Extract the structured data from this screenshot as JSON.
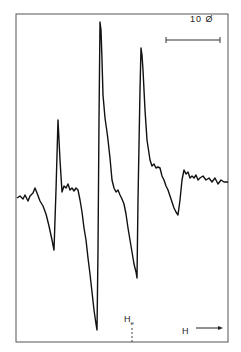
{
  "chart_data": {
    "type": "line",
    "title": "",
    "xlabel": "H",
    "ylabel": "",
    "grid": false,
    "legend": null,
    "annotations": [
      {
        "text": "10 Ø",
        "kind": "scale-bar",
        "description": "horizontal scale bar indicating 10 gauss"
      },
      {
        "text": "He",
        "kind": "marker",
        "description": "dashed tick marking field position He"
      },
      {
        "text": "H →",
        "kind": "axis-direction",
        "description": "arrow indicating increasing field direction"
      }
    ],
    "series": [
      {
        "name": "EPR derivative spectrum",
        "points_px": [
          [
            17,
            198
          ],
          [
            20,
            196
          ],
          [
            23,
            199
          ],
          [
            25,
            195
          ],
          [
            28,
            201
          ],
          [
            30,
            196
          ],
          [
            33,
            193
          ],
          [
            35,
            188
          ],
          [
            37,
            193
          ],
          [
            40,
            201
          ],
          [
            43,
            206
          ],
          [
            46,
            214
          ],
          [
            49,
            226
          ],
          [
            52,
            240
          ],
          [
            54,
            250
          ],
          [
            56,
            190
          ],
          [
            58,
            120
          ],
          [
            60,
            160
          ],
          [
            62,
            192
          ],
          [
            64,
            186
          ],
          [
            66,
            188
          ],
          [
            68,
            184
          ],
          [
            70,
            190
          ],
          [
            72,
            188
          ],
          [
            74,
            191
          ],
          [
            76,
            188
          ],
          [
            78,
            190
          ],
          [
            80,
            200
          ],
          [
            82,
            212
          ],
          [
            84,
            228
          ],
          [
            86,
            240
          ],
          [
            88,
            258
          ],
          [
            90,
            274
          ],
          [
            92,
            292
          ],
          [
            94,
            310
          ],
          [
            96,
            324
          ],
          [
            97,
            330
          ],
          [
            98,
            250
          ],
          [
            99,
            120
          ],
          [
            100,
            22
          ],
          [
            101,
            30
          ],
          [
            102,
            60
          ],
          [
            103,
            95
          ],
          [
            105,
            118
          ],
          [
            107,
            132
          ],
          [
            108,
            140
          ],
          [
            110,
            158
          ],
          [
            112,
            180
          ],
          [
            114,
            188
          ],
          [
            116,
            192
          ],
          [
            118,
            190
          ],
          [
            120,
            195
          ],
          [
            122,
            199
          ],
          [
            124,
            204
          ],
          [
            126,
            214
          ],
          [
            128,
            228
          ],
          [
            130,
            240
          ],
          [
            132,
            252
          ],
          [
            134,
            264
          ],
          [
            136,
            272
          ],
          [
            137,
            278
          ],
          [
            138,
            200
          ],
          [
            140,
            90
          ],
          [
            141,
            48
          ],
          [
            142,
            55
          ],
          [
            143,
            70
          ],
          [
            145,
            110
          ],
          [
            147,
            140
          ],
          [
            150,
            160
          ],
          [
            152,
            166
          ],
          [
            154,
            164
          ],
          [
            156,
            168
          ],
          [
            158,
            167
          ],
          [
            160,
            168
          ],
          [
            162,
            176
          ],
          [
            164,
            180
          ],
          [
            166,
            186
          ],
          [
            168,
            190
          ],
          [
            170,
            196
          ],
          [
            172,
            202
          ],
          [
            174,
            208
          ],
          [
            176,
            212
          ],
          [
            178,
            215
          ],
          [
            180,
            200
          ],
          [
            182,
            180
          ],
          [
            184,
            170
          ],
          [
            186,
            174
          ],
          [
            188,
            172
          ],
          [
            190,
            178
          ],
          [
            192,
            176
          ],
          [
            194,
            178
          ],
          [
            196,
            175
          ],
          [
            198,
            180
          ],
          [
            200,
            178
          ],
          [
            203,
            176
          ],
          [
            206,
            180
          ],
          [
            209,
            178
          ],
          [
            212,
            182
          ],
          [
            215,
            178
          ],
          [
            218,
            184
          ],
          [
            221,
            180
          ],
          [
            224,
            182
          ],
          [
            228,
            182
          ]
        ]
      }
    ],
    "frame_px": {
      "left": 16,
      "top": 14,
      "right": 228,
      "bottom": 342
    },
    "scale_bar_px": {
      "x1": 166,
      "x2": 220,
      "y": 40
    }
  },
  "labels": {
    "scale": "10 Ø",
    "he_main": "H",
    "he_sub": "e",
    "h_axis": "H ⟶"
  }
}
